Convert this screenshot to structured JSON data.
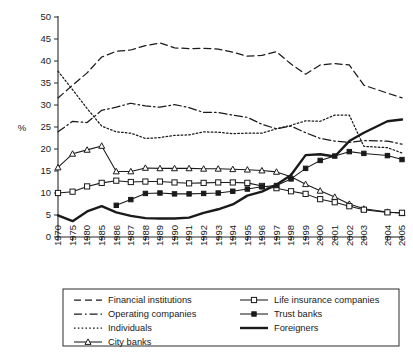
{
  "chart_data": {
    "type": "line",
    "title": "",
    "xlabel": "",
    "ylabel": "%",
    "ylim": [
      0,
      50
    ],
    "ytick_labels": [
      "0",
      "5",
      "10",
      "15",
      "20",
      "25",
      "30",
      "35",
      "40",
      "45",
      "50"
    ],
    "ytick_values": [
      0,
      5,
      10,
      15,
      20,
      25,
      30,
      35,
      40,
      45,
      50
    ],
    "grid": false,
    "legend_position": "bottom",
    "axis_break_after": "2003",
    "categories": [
      "1970",
      "1975",
      "1980",
      "1985",
      "1986",
      "1987",
      "1988",
      "1989",
      "1990",
      "1991",
      "1992",
      "1993",
      "1994",
      "1995",
      "1996",
      "1997",
      "1998",
      "1999",
      "2000",
      "2001",
      "2002",
      "2003",
      "2004",
      "2005"
    ],
    "series": [
      {
        "name": "Financial institutions",
        "style": "dashed",
        "marker": "none",
        "values": [
          31.6,
          34.5,
          37.3,
          40.9,
          42.2,
          42.5,
          43.5,
          44.1,
          43.0,
          42.8,
          42.9,
          42.7,
          42.0,
          41.1,
          41.3,
          42.1,
          39.3,
          37.0,
          39.1,
          39.4,
          39.1,
          34.5,
          32.7,
          31.6
        ]
      },
      {
        "name": "Operating companies",
        "style": "dashdot",
        "marker": "none",
        "values": [
          23.9,
          26.3,
          26.0,
          28.8,
          29.5,
          30.4,
          29.8,
          29.5,
          30.1,
          29.4,
          28.3,
          28.3,
          27.7,
          27.2,
          25.6,
          24.6,
          25.2,
          23.7,
          22.4,
          21.8,
          21.5,
          21.9,
          21.8,
          21.1
        ]
      },
      {
        "name": "Individuals",
        "style": "dotted",
        "marker": "none",
        "values": [
          37.7,
          33.5,
          29.2,
          25.2,
          23.9,
          23.6,
          22.4,
          22.6,
          23.1,
          23.2,
          23.9,
          23.8,
          23.5,
          23.6,
          23.6,
          24.6,
          25.4,
          26.4,
          26.3,
          27.7,
          27.7,
          20.6,
          20.3,
          19.1
        ]
      },
      {
        "name": "City banks",
        "style": "solid",
        "marker": "triangle",
        "values": [
          15.8,
          18.9,
          19.8,
          20.7,
          14.9,
          14.9,
          15.7,
          15.6,
          15.6,
          15.6,
          15.5,
          15.5,
          15.4,
          15.3,
          15.1,
          14.8,
          13.7,
          12.0,
          10.5,
          9.1,
          7.5,
          6.4,
          5.7,
          5.4
        ]
      },
      {
        "name": "Life insurance companies",
        "style": "solid",
        "marker": "square",
        "values": [
          10.0,
          10.3,
          11.5,
          12.3,
          12.8,
          12.5,
          12.6,
          12.6,
          12.4,
          12.2,
          12.3,
          12.4,
          12.4,
          12.3,
          11.6,
          11.1,
          10.4,
          9.8,
          8.6,
          7.9,
          7.0,
          6.2,
          5.6,
          5.5
        ]
      },
      {
        "name": "Trust banks",
        "style": "solid",
        "marker": "filled-square",
        "values": [
          null,
          null,
          null,
          null,
          7.2,
          8.5,
          9.9,
          10.0,
          9.8,
          9.8,
          9.9,
          10.0,
          10.4,
          10.9,
          11.4,
          11.7,
          13.2,
          15.6,
          17.4,
          18.4,
          19.4,
          19.0,
          18.5,
          17.6
        ]
      },
      {
        "name": "Foreigners",
        "style": "solid-thick",
        "marker": "none",
        "values": [
          4.9,
          3.6,
          5.8,
          7.0,
          5.6,
          4.8,
          4.3,
          4.2,
          4.2,
          4.4,
          5.5,
          6.3,
          7.4,
          9.4,
          10.3,
          11.9,
          14.1,
          18.6,
          18.8,
          18.3,
          21.8,
          23.7,
          26.3,
          26.7
        ]
      }
    ]
  },
  "legend": {
    "items": [
      {
        "label": "Financial institutions",
        "style": "dashed",
        "marker": "none"
      },
      {
        "label": "Life insurance companies",
        "style": "solid",
        "marker": "square"
      },
      {
        "label": "Operating companies",
        "style": "dashdot",
        "marker": "none"
      },
      {
        "label": "Trust banks",
        "style": "solid",
        "marker": "filled-square"
      },
      {
        "label": "Individuals",
        "style": "dotted",
        "marker": "none"
      },
      {
        "label": "Foreigners",
        "style": "solid-thick",
        "marker": "none"
      },
      {
        "label": "City banks",
        "style": "solid",
        "marker": "triangle"
      }
    ]
  },
  "colors": {
    "ink": "#1a1a1a",
    "axis": "#2b2b2b",
    "background": "#ffffff"
  }
}
